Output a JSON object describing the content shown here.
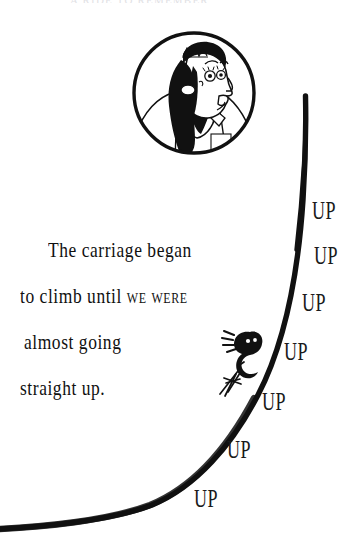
{
  "page": {
    "background_color": "#ffffff",
    "ink_color": "#111111",
    "top_clipped_text": "A RIDE TO REMEMBER"
  },
  "portrait": {
    "icon": "woman-with-tiara-portrait-icon",
    "description": "Circular ink portrait of a woman in profile wearing a tiara, long dark ponytail and collared shirt"
  },
  "story": {
    "lines": [
      {
        "text": "The carriage began",
        "smallcaps": ""
      },
      {
        "text": "to climb until ",
        "smallcaps": "we were"
      },
      {
        "text": "almost going",
        "smallcaps": ""
      },
      {
        "text": "straight up.",
        "smallcaps": ""
      }
    ],
    "full_text": "The carriage began to climb until we were almost going straight up."
  },
  "rider": {
    "icon": "stick-figure-rider-icon",
    "description": "Small hand-drawn figure with arms raised riding the rising track"
  },
  "track": {
    "icon": "roller-coaster-track-icon",
    "description": "Thick hand-inked curve sweeping from lower-left flat to a steep near-vertical rise at upper-right",
    "stroke_color": "#111111"
  },
  "up_words": [
    {
      "label": "UP",
      "x": 312,
      "y": 198
    },
    {
      "label": "UP",
      "x": 314,
      "y": 243
    },
    {
      "label": "UP",
      "x": 302,
      "y": 290
    },
    {
      "label": "UP",
      "x": 284,
      "y": 339
    },
    {
      "label": "UP",
      "x": 262,
      "y": 389
    },
    {
      "label": "UP",
      "x": 227,
      "y": 437
    },
    {
      "label": "UP",
      "x": 194,
      "y": 486
    }
  ]
}
